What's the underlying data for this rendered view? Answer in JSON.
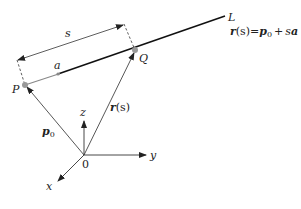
{
  "diagram": {
    "line_label": "L",
    "equation": {
      "r": "r",
      "s_paren": "(s)",
      "eq": "=",
      "p": "p",
      "p_sub": "0",
      "plus": "+",
      "s": "s",
      "a": "a"
    },
    "points": {
      "P": "P",
      "Q": "Q"
    },
    "dimension_label": "s",
    "direction_vector_label": "a",
    "vector_p0": {
      "p": "p",
      "sub": "0"
    },
    "vector_r": {
      "r": "r",
      "paren": "(s)"
    },
    "axes": {
      "x": "x",
      "y": "y",
      "z": "z",
      "origin": "0"
    },
    "colors": {
      "line": "#111111",
      "vector": "#444444",
      "point": "#999999",
      "direction": "#888888"
    }
  }
}
